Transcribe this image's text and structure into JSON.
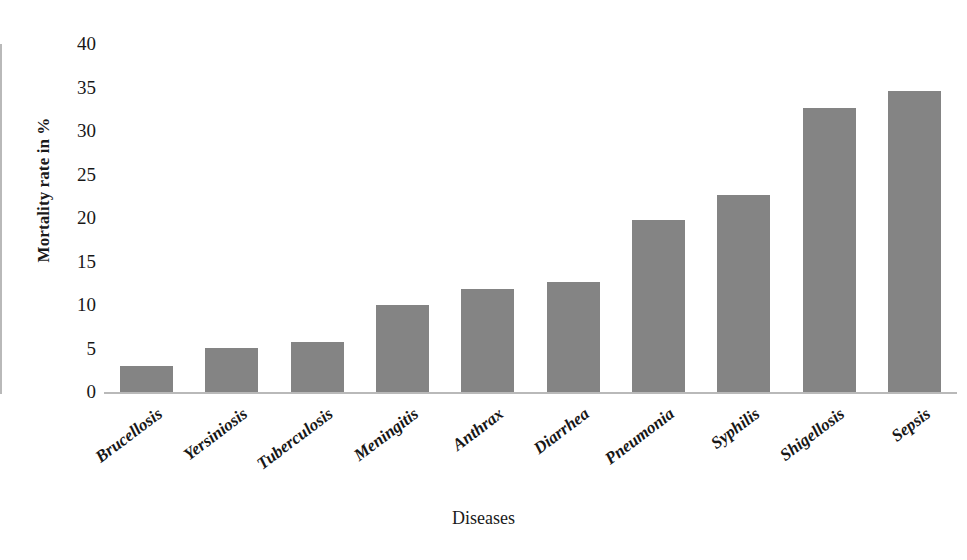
{
  "chart_data": {
    "type": "bar",
    "title": "",
    "subtitle": "",
    "xlabel": "Diseases",
    "ylabel": "Mortality rate in %",
    "categories": [
      "Brucellosis",
      "Yersiniosis",
      "Tuberculosis",
      "Meningitis",
      "Anthrax",
      "Diarrhea",
      "Pneumonia",
      "Syphilis",
      "Shigellosis",
      "Sepsis"
    ],
    "values": [
      3.0,
      5.1,
      5.8,
      10.0,
      11.8,
      12.6,
      19.8,
      22.7,
      32.7,
      34.6
    ],
    "ylim": [
      0,
      40
    ],
    "yticks": [
      "0",
      "5",
      "10",
      "15",
      "20",
      "25",
      "30",
      "35",
      "40"
    ],
    "ytick_values": [
      0,
      5,
      10,
      15,
      20,
      25,
      30,
      35,
      40
    ],
    "grid": false,
    "legend": false,
    "legend_position": "none",
    "bar_color": "#848484",
    "axis_color": "#b9b9b9",
    "background_color": "#ffffff",
    "text_color": "#171717",
    "xtick_rotation_deg": -37
  }
}
